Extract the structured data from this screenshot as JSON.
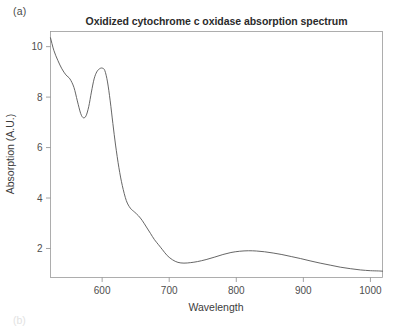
{
  "figure": {
    "panel_label": "(a)",
    "panel_label_next": "(b)"
  },
  "chart_data": {
    "type": "line",
    "title": "Oxidized cytochrome c oxidase absorption spectrum",
    "xlabel": "Wavelength",
    "ylabel": "Absorption (A.U.)",
    "xlim": [
      523,
      1018
    ],
    "ylim": [
      0.85,
      10.6
    ],
    "xticks": [
      600,
      700,
      800,
      900,
      1000
    ],
    "xticklabels": [
      "600",
      "700",
      "800",
      "900",
      "1000"
    ],
    "yticks": [
      2,
      4,
      6,
      8,
      10
    ],
    "yticklabels": [
      "2",
      "4",
      "6",
      "8",
      "10"
    ],
    "grid": false,
    "legend": null,
    "line_color": "#555555",
    "series": [
      {
        "name": "Oxidized cytochrome c oxidase",
        "x": [
          523,
          528,
          534,
          540,
          546,
          552,
          558,
          563,
          568,
          572,
          576,
          580,
          584,
          588,
          592,
          596,
          600,
          604,
          608,
          612,
          616,
          620,
          625,
          630,
          636,
          642,
          648,
          654,
          660,
          666,
          672,
          678,
          684,
          690,
          697,
          705,
          713,
          722,
          732,
          742,
          755,
          768,
          780,
          792,
          805,
          818,
          830,
          842,
          855,
          868,
          882,
          896,
          910,
          925,
          940,
          955,
          970,
          985,
          1000,
          1012,
          1018
        ],
        "y": [
          10.35,
          9.85,
          9.45,
          9.12,
          8.88,
          8.72,
          8.38,
          7.85,
          7.35,
          7.18,
          7.26,
          7.62,
          8.2,
          8.72,
          9.0,
          9.12,
          9.15,
          9.05,
          8.6,
          7.85,
          6.95,
          6.1,
          5.2,
          4.5,
          3.9,
          3.6,
          3.45,
          3.3,
          3.1,
          2.85,
          2.6,
          2.35,
          2.15,
          1.95,
          1.72,
          1.55,
          1.45,
          1.42,
          1.44,
          1.48,
          1.56,
          1.66,
          1.76,
          1.84,
          1.89,
          1.91,
          1.9,
          1.87,
          1.82,
          1.76,
          1.68,
          1.6,
          1.51,
          1.42,
          1.34,
          1.26,
          1.2,
          1.15,
          1.12,
          1.11,
          1.1
        ]
      }
    ]
  }
}
